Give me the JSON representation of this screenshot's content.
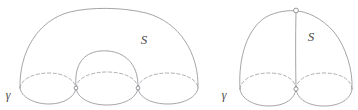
{
  "figure": {
    "caption": "",
    "stroke_color": "#8e8e94",
    "hidden_stroke_color": "#9b9ba1",
    "node_stroke_color": "#7e7e84",
    "label_color": "#4a4a4a",
    "background": "#ffffff"
  },
  "left_diagram": {
    "name": "three-lobed-surface",
    "surface_label": "S",
    "boundary_label": "γ",
    "node_count": 2,
    "lobe_count": 3,
    "outer_dome": {
      "left_foot_x": 20,
      "right_foot_x": 198,
      "apex_y": 10
    },
    "inner_dome": {
      "left_foot_x": 76,
      "right_foot_x": 138,
      "apex_y": 51
    },
    "nodes": [
      {
        "x": 76,
        "y": 88
      },
      {
        "x": 138,
        "y": 88
      }
    ],
    "disks": [
      {
        "cx": 48,
        "cy": 88,
        "rx": 28,
        "ry": 12
      },
      {
        "cx": 107,
        "cy": 88,
        "rx": 31,
        "ry": 12
      },
      {
        "cx": 168,
        "cy": 88,
        "rx": 30,
        "ry": 12
      }
    ]
  },
  "right_diagram": {
    "name": "two-lobed-surface",
    "surface_label": "S",
    "boundary_label": "γ",
    "node_count": 2,
    "lobe_count": 2,
    "top_node": {
      "x": 296,
      "y": 11
    },
    "bottom_node": {
      "x": 296,
      "y": 89
    },
    "outer_dome": {
      "left_foot_x": 240,
      "right_foot_x": 352,
      "apex_y": 11
    },
    "disks": [
      {
        "cx": 268,
        "cy": 89,
        "rx": 28,
        "ry": 12
      },
      {
        "cx": 324,
        "cy": 89,
        "rx": 28,
        "ry": 12
      }
    ]
  },
  "labels": {
    "left_S": {
      "text": "S",
      "x": 144,
      "y": 44
    },
    "left_gamma": {
      "text": "γ",
      "x": 6,
      "y": 98
    },
    "right_S": {
      "text": "S",
      "x": 307,
      "y": 40
    },
    "right_gamma": {
      "text": "γ",
      "x": 222,
      "y": 98
    }
  }
}
